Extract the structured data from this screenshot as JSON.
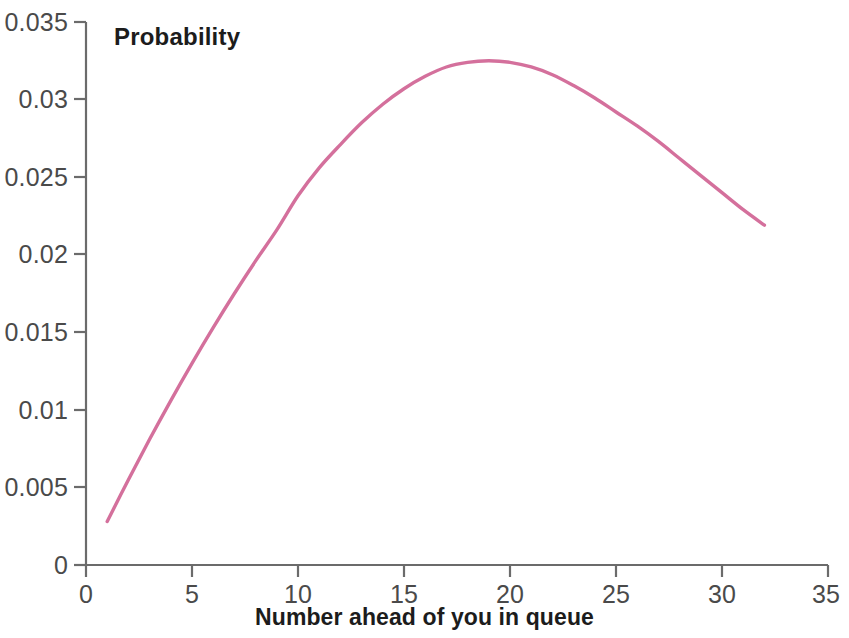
{
  "chart_data": {
    "type": "line",
    "title": "",
    "series_label": "Probability",
    "xlabel": "Number ahead of you in queue",
    "ylabel": "",
    "xlim": [
      0,
      35
    ],
    "ylim": [
      0,
      0.035
    ],
    "grid": false,
    "legend_position": "inside-top-left",
    "line_color": "#d4709c",
    "axis_color": "#6b6b6b",
    "x_ticks": [
      0,
      5,
      10,
      15,
      20,
      25,
      30,
      35
    ],
    "x_tick_labels": [
      "0",
      "5",
      "10",
      "15",
      "20",
      "25",
      "30",
      "35"
    ],
    "y_ticks": [
      0,
      0.005,
      0.01,
      0.015,
      0.02,
      0.025,
      0.03,
      0.035
    ],
    "y_tick_labels": [
      "0",
      "0.005",
      "0.01",
      "0.015",
      "0.02",
      "0.025",
      "0.03",
      "0.035"
    ],
    "x": [
      1,
      2,
      3,
      4,
      5,
      6,
      7,
      8,
      9,
      10,
      11,
      12,
      13,
      14,
      15,
      16,
      17,
      18,
      19,
      20,
      21,
      22,
      23,
      24,
      25,
      26,
      27,
      28,
      29,
      30,
      31,
      32
    ],
    "values": [
      0.0028,
      0.0055,
      0.0081,
      0.0106,
      0.013,
      0.0153,
      0.0175,
      0.0196,
      0.0216,
      0.0238,
      0.0256,
      0.0271,
      0.0285,
      0.0297,
      0.0307,
      0.0315,
      0.0321,
      0.0324,
      0.0325,
      0.0324,
      0.0321,
      0.0316,
      0.0309,
      0.0301,
      0.0292,
      0.0283,
      0.0273,
      0.0262,
      0.0251,
      0.024,
      0.0229,
      0.0219
    ],
    "peak": {
      "x": 19,
      "y": 0.0325
    }
  },
  "chart_text": {
    "series_label": "Probability",
    "xaxis_title": "Number ahead of you in queue"
  }
}
